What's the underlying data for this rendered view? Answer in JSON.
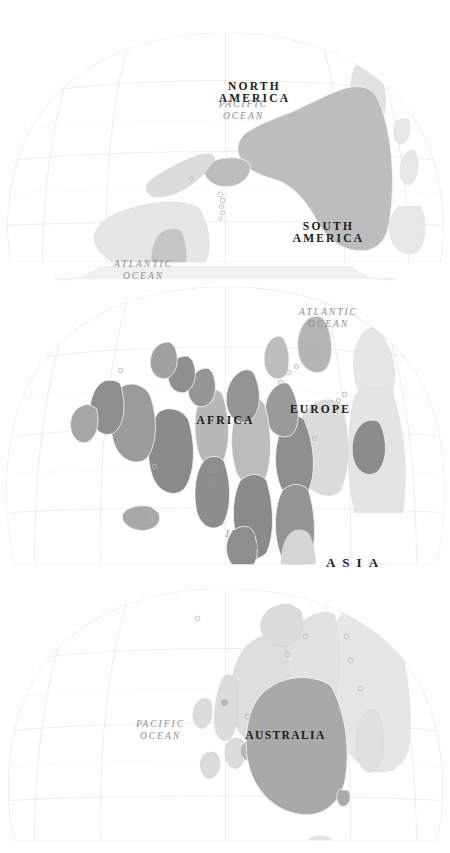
{
  "map": {
    "title": "World Map",
    "projection": "interrupted-goode-homolosine",
    "orientation_degrees": 90,
    "background_color": "#ffffff",
    "graticule_color": "#e3e3e3",
    "coastline_color": "#d8d8d8",
    "land_default_color": "#e8e8e8",
    "land_secondary_color": "#d2d2d2",
    "highlight_mid_color": "#b9b9b9",
    "highlight_dark_color": "#909090",
    "border_color": "#f5f5f5",
    "continent_labels": [
      {
        "id": "north-america",
        "lines": [
          "NORTH",
          "AMERICA"
        ]
      },
      {
        "id": "south-america",
        "lines": [
          "SOUTH",
          "AMERICA"
        ]
      },
      {
        "id": "africa",
        "lines": [
          "AFRICA"
        ]
      },
      {
        "id": "europe",
        "lines": [
          "EUROPE"
        ]
      },
      {
        "id": "asia",
        "lines": [
          "ASIA"
        ]
      },
      {
        "id": "australia",
        "lines": [
          "AUSTRALIA"
        ]
      }
    ],
    "ocean_labels": [
      {
        "id": "pacific-ocean-west",
        "lines": [
          "PACIFIC",
          "OCEAN"
        ]
      },
      {
        "id": "indian-ocean",
        "lines": [
          "INDIAN",
          "OCEAN"
        ]
      },
      {
        "id": "atlantic-ocean-north",
        "lines": [
          "ATLANTIC",
          "OCEAN"
        ]
      },
      {
        "id": "atlantic-ocean-south",
        "lines": [
          "ATLANTIC",
          "OCEAN"
        ]
      },
      {
        "id": "pacific-ocean-east",
        "lines": [
          "PACIFIC",
          "OCEAN"
        ]
      }
    ]
  }
}
